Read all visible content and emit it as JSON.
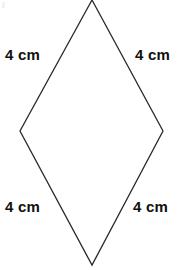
{
  "figure": {
    "type": "rhombus",
    "background_color": "#ffffff",
    "stroke_color": "#2a2a2a",
    "stroke_width": 1.3,
    "fill_color": "none",
    "canvas": {
      "width": 180,
      "height": 270
    },
    "vertices": {
      "top": {
        "x": 92,
        "y": 0
      },
      "right": {
        "x": 163,
        "y": 131
      },
      "bottom": {
        "x": 92,
        "y": 265
      },
      "left": {
        "x": 20,
        "y": 131
      }
    },
    "polygon_points": "92,0 163,131 92,265 20,131"
  },
  "labels": {
    "top_left": "4 cm",
    "top_right": "4 cm",
    "bottom_left": "4 cm",
    "bottom_right": "4 cm"
  }
}
